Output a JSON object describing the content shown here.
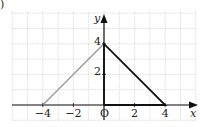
{
  "part_marker": ")",
  "axes": {
    "x_label": "x",
    "y_label": "y",
    "origin_label": "O",
    "x_ticks": [
      {
        "value": -4,
        "label": "−4"
      },
      {
        "value": -2,
        "label": "−2"
      },
      {
        "value": 2,
        "label": "2"
      },
      {
        "value": 4,
        "label": "4"
      }
    ],
    "y_ticks": [
      {
        "value": 2,
        "label": "2"
      },
      {
        "value": 4,
        "label": "4"
      }
    ],
    "x_range": [
      -6,
      6
    ],
    "y_range": [
      -1,
      6
    ]
  },
  "shapes": [
    {
      "name": "gray-line",
      "color": "#9a9a9a",
      "points": [
        [
          -4,
          0
        ],
        [
          0,
          4
        ]
      ]
    },
    {
      "name": "black-triangle",
      "color": "#111111",
      "points": [
        [
          0,
          0
        ],
        [
          0,
          4
        ],
        [
          4,
          0
        ],
        [
          0,
          0
        ]
      ]
    }
  ],
  "colors": {
    "grid": "#c8c8c8",
    "axis": "#111111"
  }
}
